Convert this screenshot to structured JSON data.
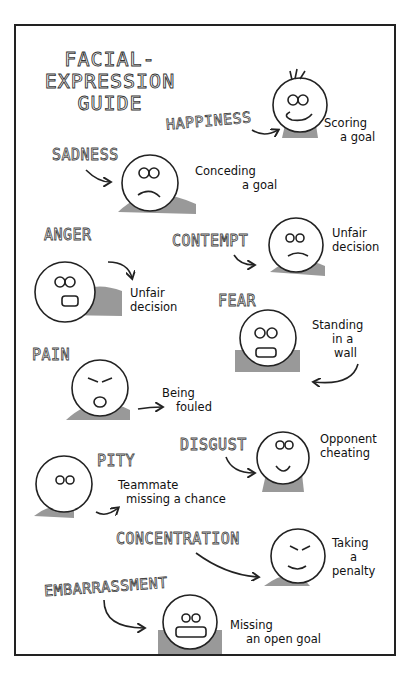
{
  "title": [
    "FACIAL-",
    "EXPRESSION",
    "GUIDE"
  ],
  "expressions": [
    {
      "label": "HAPPINESS",
      "caption": [
        "Scoring",
        "a goal"
      ]
    },
    {
      "label": "SADNESS",
      "caption": [
        "Conceding",
        "a goal"
      ]
    },
    {
      "label": "ANGER",
      "caption": [
        "Unfair",
        "decision"
      ]
    },
    {
      "label": "CONTEMPT",
      "caption": [
        "Unfair",
        "decision"
      ]
    },
    {
      "label": "FEAR",
      "caption": [
        "Standing",
        "in a",
        "wall"
      ]
    },
    {
      "label": "PAIN",
      "caption": [
        "Being",
        "fouled"
      ]
    },
    {
      "label": "DISGUST",
      "caption": [
        "Opponent",
        "cheating"
      ]
    },
    {
      "label": "PITY",
      "caption": [
        "Teammate",
        "missing a chance"
      ]
    },
    {
      "label": "CONCENTRATION",
      "caption": [
        "Taking",
        "a",
        "penalty"
      ]
    },
    {
      "label": "EMBARRASSMENT",
      "caption": [
        "Missing",
        "an open goal"
      ]
    }
  ]
}
